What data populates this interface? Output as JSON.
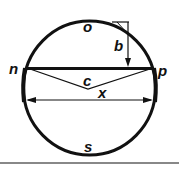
{
  "diagram": {
    "labels": {
      "top": "o",
      "bottom": "s",
      "left": "n",
      "right": "p",
      "sagitta": "b",
      "center": "c",
      "width": "x"
    },
    "colors": {
      "stroke": "#111111",
      "background": "#ffffff",
      "divider": "#888888"
    }
  }
}
